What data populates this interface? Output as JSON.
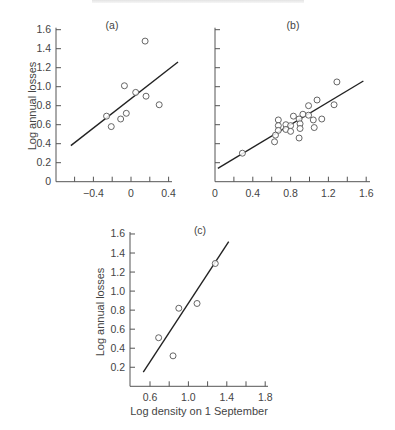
{
  "chart_data": [
    {
      "panel": "(a)",
      "type": "scatter",
      "title": "(a)",
      "xlabel": "",
      "ylabel": "Log annual losses",
      "xlim": [
        -0.6,
        0.45
      ],
      "ylim": [
        0,
        1.6
      ],
      "xticks": [
        -0.6,
        -0.4,
        -0.2,
        0,
        0.2,
        0.4
      ],
      "xtick_labels": [
        "-0.4",
        "0",
        "0.4"
      ],
      "xtick_label_values": [
        -0.4,
        0,
        0.4
      ],
      "yticks": [
        0,
        0.2,
        0.4,
        0.6,
        0.8,
        1.0,
        1.2,
        1.4,
        1.6
      ],
      "ytick_labels": [
        "0",
        "0.2",
        "0.4",
        "0.6",
        "0.8",
        "1.0",
        "1.2",
        "1.4",
        "1.6"
      ],
      "grid": false,
      "points": [
        {
          "x": 0.15,
          "y": 1.48
        },
        {
          "x": -0.07,
          "y": 1.01
        },
        {
          "x": 0.05,
          "y": 0.94
        },
        {
          "x": 0.16,
          "y": 0.9
        },
        {
          "x": 0.3,
          "y": 0.81
        },
        {
          "x": -0.26,
          "y": 0.69
        },
        {
          "x": -0.05,
          "y": 0.72
        },
        {
          "x": -0.11,
          "y": 0.66
        },
        {
          "x": -0.21,
          "y": 0.58
        }
      ],
      "fit_line": {
        "x": [
          -0.64,
          0.5
        ],
        "y": [
          0.38,
          1.26
        ]
      }
    },
    {
      "panel": "(b)",
      "type": "scatter",
      "title": "(b)",
      "xlabel": "",
      "ylabel": "",
      "xlim": [
        0,
        1.6
      ],
      "ylim": [
        0,
        1.6
      ],
      "xticks": [
        0,
        0.2,
        0.4,
        0.6,
        0.8,
        1.0,
        1.2,
        1.4,
        1.6
      ],
      "xtick_labels": [
        "0",
        "0.4",
        "0.8",
        "1.2",
        "1.6"
      ],
      "xtick_label_values": [
        0,
        0.4,
        0.8,
        1.2,
        1.6
      ],
      "yticks": [
        0.2,
        0.4,
        0.6,
        0.8,
        1.0,
        1.2,
        1.4,
        1.6
      ],
      "ytick_labels": [],
      "grid": false,
      "points": [
        {
          "x": 0.29,
          "y": 0.3
        },
        {
          "x": 1.29,
          "y": 1.05
        },
        {
          "x": 1.08,
          "y": 0.86
        },
        {
          "x": 0.99,
          "y": 0.8
        },
        {
          "x": 1.26,
          "y": 0.81
        },
        {
          "x": 0.83,
          "y": 0.69
        },
        {
          "x": 0.93,
          "y": 0.71
        },
        {
          "x": 0.99,
          "y": 0.7
        },
        {
          "x": 0.67,
          "y": 0.65
        },
        {
          "x": 0.67,
          "y": 0.59
        },
        {
          "x": 0.75,
          "y": 0.6
        },
        {
          "x": 0.89,
          "y": 0.66
        },
        {
          "x": 0.8,
          "y": 0.59
        },
        {
          "x": 1.04,
          "y": 0.65
        },
        {
          "x": 1.13,
          "y": 0.66
        },
        {
          "x": 0.9,
          "y": 0.61
        },
        {
          "x": 0.67,
          "y": 0.54
        },
        {
          "x": 0.75,
          "y": 0.55
        },
        {
          "x": 0.8,
          "y": 0.53
        },
        {
          "x": 0.64,
          "y": 0.49
        },
        {
          "x": 0.9,
          "y": 0.56
        },
        {
          "x": 1.05,
          "y": 0.57
        },
        {
          "x": 0.63,
          "y": 0.42
        },
        {
          "x": 0.89,
          "y": 0.46
        }
      ],
      "fit_line": {
        "x": [
          0.03,
          1.57
        ],
        "y": [
          0.14,
          1.06
        ]
      }
    },
    {
      "panel": "(c)",
      "type": "scatter",
      "title": "(c)",
      "xlabel": "Log density on 1 September",
      "ylabel": "Log annual losses",
      "xlim": [
        0.4,
        1.8
      ],
      "ylim": [
        0,
        1.6
      ],
      "xticks": [
        0.6,
        0.8,
        1.0,
        1.2,
        1.4,
        1.6,
        1.8
      ],
      "xtick_labels": [
        "0.6",
        "1.0",
        "1.4",
        "1.8"
      ],
      "xtick_label_values": [
        0.6,
        1.0,
        1.4,
        1.8
      ],
      "yticks": [
        0.2,
        0.4,
        0.6,
        0.8,
        1.0,
        1.2,
        1.4,
        1.6
      ],
      "ytick_labels": [
        "0.2",
        "0.4",
        "0.6",
        "0.8",
        "1.0",
        "1.2",
        "1.4",
        "1.6"
      ],
      "grid": false,
      "points": [
        {
          "x": 1.28,
          "y": 1.29
        },
        {
          "x": 1.09,
          "y": 0.87
        },
        {
          "x": 0.9,
          "y": 0.82
        },
        {
          "x": 0.69,
          "y": 0.51
        },
        {
          "x": 0.84,
          "y": 0.32
        }
      ],
      "fit_line": {
        "x": [
          0.53,
          1.42
        ],
        "y": [
          0.15,
          1.52
        ]
      }
    }
  ],
  "colors": {
    "axis": "#555555",
    "line": "#222222",
    "marker_stroke": "#555555",
    "text": "#444444"
  }
}
